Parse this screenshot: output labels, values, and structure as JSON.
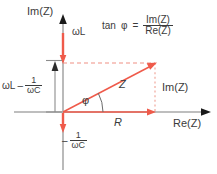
{
  "diagram": {
    "colors": {
      "phasor_red": "#ef5a4a",
      "axis_gray": "#a9a9a9",
      "text_gray": "#3b3b3b",
      "bracket_gray": "#8c8c8c",
      "background": "#ffffff"
    },
    "axes": {
      "imaginary_label": "Im(Z)",
      "real_label": "Re(Z)"
    },
    "labels": {
      "omega_l": "ωL",
      "vector_z": "Z",
      "angle_phi": "φ",
      "resistance": "R",
      "imaginary_component": "Im(Z)"
    },
    "reactance_bracket": {
      "omega_l": "ωL",
      "minus": "–",
      "numerator": "1",
      "denominator": "ωC"
    },
    "capacitive_reactance": {
      "minus": "–",
      "numerator": "1",
      "denominator": "ωC"
    },
    "formula": {
      "tan": "tan",
      "phi": "φ",
      "equals": "=",
      "numerator": "Im(Z)",
      "denominator": "Re(Z)"
    },
    "geometry": {
      "origin_x": 63,
      "origin_y": 112,
      "tip_x": 155,
      "tip_y": 63,
      "phi_degrees": 28
    }
  }
}
